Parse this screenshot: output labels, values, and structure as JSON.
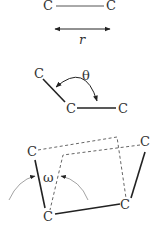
{
  "diagram": {
    "bond_length": {
      "atom_left": "C",
      "atom_right": "C",
      "symbol": "r"
    },
    "bond_angle": {
      "atom_top": "C",
      "atom_center": "C",
      "atom_right": "C",
      "symbol": "θ"
    },
    "dihedral_angle": {
      "atom_top_left": "C",
      "atom_bottom_left": "C",
      "atom_bottom_right": "C",
      "atom_top_right": "C",
      "symbol": "ω"
    },
    "colors": {
      "line": "#222222",
      "dashed": "#555555",
      "arrow_thin": "#999999",
      "text": "#333333"
    }
  }
}
